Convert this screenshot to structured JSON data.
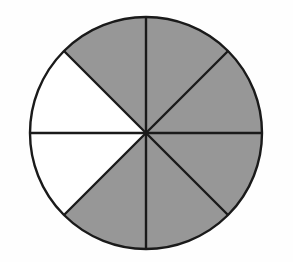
{
  "figure": {
    "name": "fraction-circle-diagram",
    "canvas": {
      "width": 293,
      "height": 262,
      "background": "#fefefe"
    },
    "circle": {
      "center_x": 146,
      "center_y": 133,
      "radius": 116,
      "outline_color": "#1a1a1a",
      "outline_width": 2.4
    },
    "sector_count": 8,
    "sector_angle_degrees": 45,
    "shaded_count": 6,
    "unshaded_count": 2,
    "fraction_shaded": "6/8",
    "colors": {
      "shaded_fill": "#979797",
      "unshaded_fill": "#ffffff",
      "divider_stroke": "#1a1a1a"
    },
    "divider_lines": [
      {
        "name": "vertical-diameter",
        "angle_degrees": 90
      },
      {
        "name": "horizontal-diameter",
        "angle_degrees": 0
      },
      {
        "name": "diagonal-diameter-45",
        "angle_degrees": 45
      },
      {
        "name": "diagonal-diameter-135",
        "angle_degrees": 135
      }
    ],
    "sectors": [
      {
        "id": "sector-1",
        "start_degrees": 0,
        "end_degrees": 45,
        "shaded": true,
        "position": "east-upper"
      },
      {
        "id": "sector-2",
        "start_degrees": 45,
        "end_degrees": 90,
        "shaded": true,
        "position": "north-upper-right"
      },
      {
        "id": "sector-3",
        "start_degrees": 90,
        "end_degrees": 135,
        "shaded": true,
        "position": "north-upper-left"
      },
      {
        "id": "sector-4",
        "start_degrees": 135,
        "end_degrees": 180,
        "shaded": false,
        "position": "west-upper"
      },
      {
        "id": "sector-5",
        "start_degrees": 180,
        "end_degrees": 225,
        "shaded": false,
        "position": "west-lower"
      },
      {
        "id": "sector-6",
        "start_degrees": 225,
        "end_degrees": 270,
        "shaded": true,
        "position": "south-lower-left"
      },
      {
        "id": "sector-7",
        "start_degrees": 270,
        "end_degrees": 315,
        "shaded": true,
        "position": "south-lower-right"
      },
      {
        "id": "sector-8",
        "start_degrees": 315,
        "end_degrees": 360,
        "shaded": true,
        "position": "east-lower"
      }
    ]
  }
}
